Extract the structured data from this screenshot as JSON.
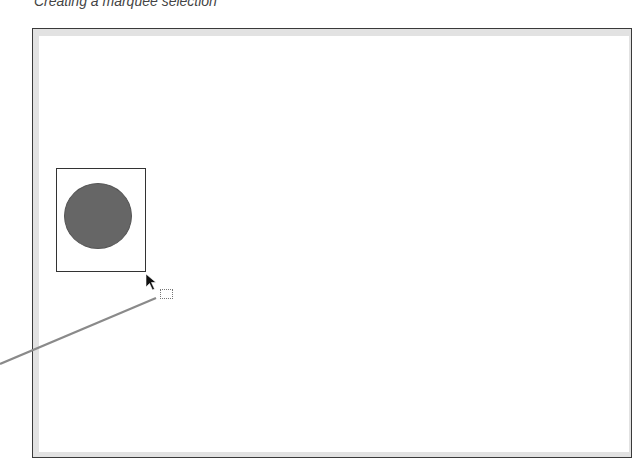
{
  "caption": "Creating a marquee selection",
  "canvas": {
    "frame_color": "#3a3a3a",
    "bevel_color": "#e2e2e2",
    "background": "#ffffff"
  },
  "objects": [
    {
      "type": "circle",
      "fill": "#666666",
      "selected_by_marquee": true
    }
  ],
  "tool": {
    "cursor": "arrow-pointer",
    "cursor_badge": "marquee-selection-rectangle"
  },
  "callout": {
    "color": "#888888"
  }
}
